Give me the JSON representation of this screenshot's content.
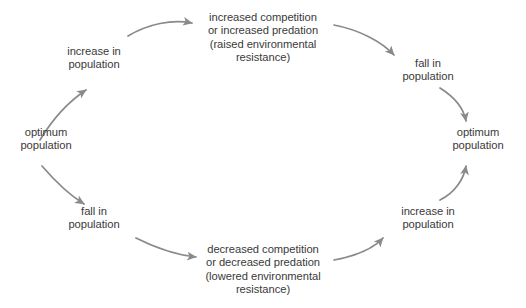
{
  "diagram": {
    "type": "cycle-diagram",
    "text_color": "#3a3a3a",
    "arrow_color": "#8a8a8a",
    "background_color": "#ffffff",
    "nodes": [
      {
        "id": "optimum-population-left",
        "label": "optimum\npopulation",
        "position": "left"
      },
      {
        "id": "increase-in-population-upper-left",
        "label": "increase in\npopulation",
        "position": "upper-left"
      },
      {
        "id": "increased-competition-top",
        "label": "increased competition\nor increased predation\n(raised environmental\nresistance)",
        "position": "top"
      },
      {
        "id": "fall-in-population-upper-right",
        "label": "fall in\npopulation",
        "position": "upper-right"
      },
      {
        "id": "optimum-population-right",
        "label": "optimum\npopulation",
        "position": "right"
      },
      {
        "id": "increase-in-population-lower-right",
        "label": "increase in\npopulation",
        "position": "lower-right"
      },
      {
        "id": "decreased-competition-bottom",
        "label": "decreased competition\nor decreased predation\n(lowered environmental\nresistance)",
        "position": "bottom"
      },
      {
        "id": "fall-in-population-lower-left",
        "label": "fall in\npopulation",
        "position": "lower-left"
      }
    ],
    "arrows": [
      {
        "id": "arrow-optimum-left-to-increase-upper",
        "from": "optimum-population-left",
        "to": "increase-in-population-upper-left",
        "path": "M 40 140 C 52 120, 68 102, 86 90"
      },
      {
        "id": "arrow-increase-upper-to-top",
        "from": "increase-in-population-upper-left",
        "to": "increased-competition-top",
        "path": "M 128 36 C 148 24, 172 19, 192 23"
      },
      {
        "id": "arrow-top-to-fall-upper",
        "from": "increased-competition-top",
        "to": "fall-in-population-upper-right",
        "path": "M 334 25 C 360 30, 382 42, 394 55"
      },
      {
        "id": "arrow-fall-upper-to-optimum-right",
        "from": "fall-in-population-upper-right",
        "to": "optimum-population-right",
        "path": "M 440 88 C 456 98, 464 110, 466 121"
      },
      {
        "id": "arrow-increase-lower-to-optimum-right",
        "from": "increase-in-population-lower-right",
        "to": "optimum-population-right",
        "path": "M 440 200 C 456 192, 464 178, 466 166"
      },
      {
        "id": "arrow-bottom-to-increase-lower",
        "from": "decreased-competition-bottom",
        "to": "increase-in-population-lower-right",
        "path": "M 334 260 C 356 256, 374 248, 383 238"
      },
      {
        "id": "arrow-fall-lower-to-bottom",
        "from": "fall-in-population-lower-left",
        "to": "decreased-competition-bottom",
        "path": "M 136 238 C 156 248, 176 255, 196 257"
      },
      {
        "id": "arrow-optimum-left-to-fall-lower",
        "from": "optimum-population-left",
        "to": "fall-in-population-lower-left",
        "path": "M 42 166 C 54 180, 68 194, 84 204"
      }
    ]
  }
}
